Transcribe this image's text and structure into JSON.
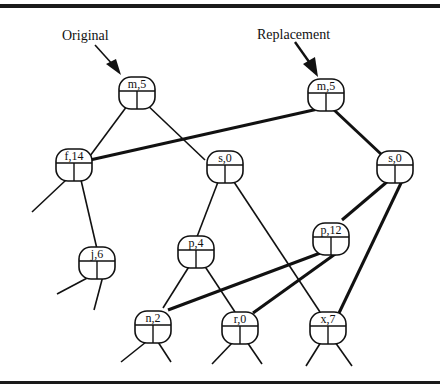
{
  "labels": {
    "original": "Original",
    "replacement": "Replacement"
  },
  "nodes": {
    "orig_m5": {
      "label": "m,5"
    },
    "orig_f14": {
      "label": "f,14"
    },
    "orig_s0": {
      "label": "s,0"
    },
    "orig_j6": {
      "label": "j,6"
    },
    "orig_p4": {
      "label": "p,4"
    },
    "n2": {
      "label": "n,2"
    },
    "r0": {
      "label": "r,0"
    },
    "x7": {
      "label": "x,7"
    },
    "repl_m5": {
      "label": "m,5"
    },
    "repl_s0": {
      "label": "s,0"
    },
    "repl_p12": {
      "label": "p,12"
    }
  },
  "colors": {
    "ink": "#111111",
    "background": "#ffffff"
  }
}
